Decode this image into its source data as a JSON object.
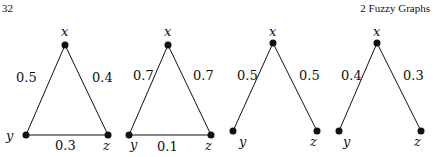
{
  "header": {
    "page_number": "32",
    "chapter": "2   Fuzzy Graphs"
  },
  "graphs": [
    {
      "type": "triangle",
      "nodes": {
        "x": "x",
        "y": "y",
        "z": "z"
      },
      "edges": {
        "xy": "0.5",
        "xz": "0.4",
        "yz": "0.3"
      }
    },
    {
      "type": "triangle",
      "nodes": {
        "x": "x",
        "y": "y",
        "z": "z"
      },
      "edges": {
        "xy": "0.7",
        "xz": "0.7",
        "yz": "0.1"
      }
    },
    {
      "type": "path",
      "nodes": {
        "x": "x",
        "y": "y",
        "z": "z"
      },
      "edges": {
        "xy": "0.5",
        "xz": "0.5"
      }
    },
    {
      "type": "path",
      "nodes": {
        "x": "x",
        "y": "y",
        "z": "z"
      },
      "edges": {
        "xy": "0.4",
        "xz": "0.3"
      }
    }
  ]
}
